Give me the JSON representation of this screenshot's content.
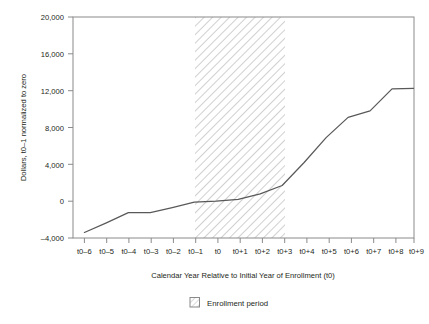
{
  "chart_data": {
    "type": "line",
    "title": "",
    "subtitle": "",
    "xlabel": "Calendar Year Relative to Initial Year of Enrollment (t0)",
    "ylabel": "Dollars, t0–1 normalized to zero",
    "categories": [
      "t0–6",
      "t0–5",
      "t0–4",
      "t0–3",
      "t0–2",
      "t0–1",
      "t0",
      "t0+1",
      "t0+2",
      "t0+3",
      "t0+4",
      "t0+5",
      "t0+6",
      "t0+7",
      "t0+8",
      "t0+9"
    ],
    "values": [
      -3400,
      -2350,
      -1250,
      -1250,
      -700,
      -100,
      0,
      200,
      800,
      1700,
      4200,
      6900,
      9100,
      9800,
      12200,
      12250
    ],
    "series": [
      {
        "name": "Dollars",
        "values": [
          -3400,
          -2350,
          -1250,
          -1250,
          -700,
          -100,
          0,
          200,
          800,
          1700,
          4200,
          6900,
          9100,
          9800,
          12200,
          12250
        ]
      }
    ],
    "ylim": [
      -4000,
      20000
    ],
    "ytick_labels": [
      "20,000",
      "16,000",
      "12,000",
      "8,000",
      "4,000",
      "0",
      "–4,000"
    ],
    "ytick_values": [
      20000,
      16000,
      12000,
      8000,
      4000,
      0,
      -4000
    ],
    "xlim": [
      "t0–6",
      "t0+9"
    ],
    "grid": false,
    "legend_position": "bottom",
    "shaded_region": {
      "label": "Enrollment period",
      "start": "t0–0.5",
      "end": "t0+3.3",
      "pattern": "diagonal-hatch"
    },
    "line_color": "#595959",
    "annotations": []
  },
  "legend": {
    "items": [
      {
        "label": "Enrollment period",
        "swatch": "hatch-square-icon"
      }
    ]
  },
  "colors": {
    "axis": "#808080",
    "line": "#595959",
    "hatch": "#bfbfbf",
    "text": "#231f20",
    "background": "#ffffff"
  }
}
